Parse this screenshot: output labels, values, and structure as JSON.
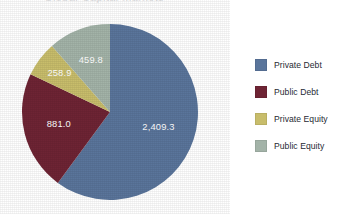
{
  "figure": {
    "background_color": "#ffffff",
    "cropped_title_text": "Global Capital Markets"
  },
  "chart_data": {
    "type": "pie",
    "title": "",
    "xlabel": "",
    "ylabel": "",
    "categories": [
      "Private Debt",
      "Public Debt",
      "Private Equity",
      "Public Equity"
    ],
    "values": [
      2409.3,
      458.0,
      258.9,
      459.8
    ],
    "value_labels": [
      "2,409.3",
      "881.0",
      "258.9",
      "459.8"
    ],
    "slice_values": [
      2409.3,
      881.0,
      258.9,
      459.8
    ],
    "colors": [
      "#5a759b",
      "#6e2434",
      "#c8bd6b",
      "#a3b3a8"
    ],
    "total": 4009.0,
    "start_angle_deg": 0,
    "direction": "clockwise",
    "legend_position": "right",
    "grid": false,
    "labels_inside": true,
    "label_color": "#ffffff",
    "slices": [
      {
        "label": "Private Debt",
        "value": 2409.3,
        "value_label": "2,409.3",
        "color": "#5a759b",
        "percent": 60.1,
        "angle_deg": 216.3
      },
      {
        "label": "Public Debt",
        "value": 881.0,
        "value_label": "881.0",
        "color": "#6e2434",
        "percent": 22.0,
        "angle_deg": 79.1
      },
      {
        "label": "Private Equity",
        "value": 258.9,
        "value_label": "258.9",
        "color": "#c8bd6b",
        "percent": 6.5,
        "angle_deg": 23.2
      },
      {
        "label": "Public Equity",
        "value": 459.8,
        "value_label": "459.8",
        "color": "#a3b3a8",
        "percent": 11.5,
        "angle_deg": 41.3
      }
    ]
  },
  "legend": {
    "items": [
      {
        "label": "Private Debt",
        "color": "#5a759b"
      },
      {
        "label": "Public Debt",
        "color": "#6e2434"
      },
      {
        "label": "Private Equity",
        "color": "#c8bd6b"
      },
      {
        "label": "Public Equity",
        "color": "#a3b3a8"
      }
    ]
  }
}
